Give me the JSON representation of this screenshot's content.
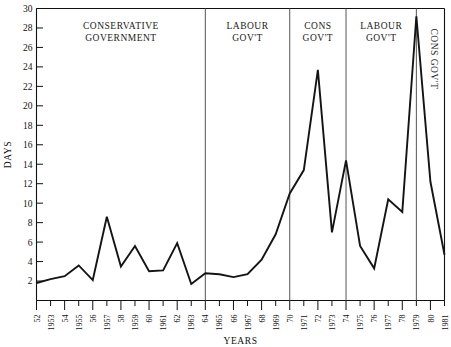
{
  "chart_data": {
    "type": "line",
    "title": "",
    "xlabel": "YEARS",
    "ylabel": "DAYS",
    "xlim": [
      1952,
      1981
    ],
    "ylim": [
      0,
      30
    ],
    "ytick_values": [
      2,
      4,
      6,
      8,
      10,
      12,
      14,
      16,
      18,
      20,
      22,
      24,
      26,
      28,
      30
    ],
    "ytick_labels": [
      "2",
      "4",
      "6",
      "8",
      "10",
      "12",
      "14",
      "16",
      "18",
      "20",
      "22",
      "24",
      "26",
      "28",
      "30"
    ],
    "grid": false,
    "legend": "none",
    "x": [
      1952,
      1953,
      1954,
      1955,
      1956,
      1957,
      1958,
      1959,
      1960,
      1961,
      1962,
      1963,
      1964,
      1965,
      1966,
      1967,
      1968,
      1969,
      1970,
      1971,
      1972,
      1973,
      1974,
      1975,
      1976,
      1977,
      1978,
      1979,
      1980,
      1981
    ],
    "xtick_labels": [
      "52",
      "1953",
      "54",
      "1955",
      "56",
      "1957",
      "58",
      "1959",
      "60",
      "1961",
      "62",
      "1963",
      "64",
      "1965",
      "66",
      "1967",
      "68",
      "1969",
      "70",
      "1971",
      "72",
      "1973",
      "74",
      "1975",
      "76",
      "1977",
      "78",
      "1979",
      "80",
      "1981"
    ],
    "values": [
      1.8,
      2.2,
      2.5,
      3.6,
      2.1,
      8.6,
      3.5,
      5.6,
      3.0,
      3.1,
      5.9,
      1.7,
      2.8,
      2.7,
      2.4,
      2.7,
      4.2,
      6.8,
      11.0,
      13.4,
      23.7,
      7.0,
      14.4,
      5.6,
      3.3,
      10.4,
      9.1,
      29.2,
      12.2,
      4.7
    ],
    "series_name": "Working days lost",
    "annotations": [
      {
        "label": "CONSERVATIVE GOVERNMENT",
        "start": 1952,
        "end": 1964,
        "orientation": "horizontal",
        "lines": [
          "CONSERVATIVE",
          "GOVERNMENT"
        ]
      },
      {
        "label": "LABOUR GOV'T",
        "start": 1964,
        "end": 1970,
        "orientation": "horizontal",
        "lines": [
          "LABOUR",
          "GOV'T"
        ]
      },
      {
        "label": "CONS GOV'T",
        "start": 1970,
        "end": 1974,
        "orientation": "horizontal",
        "lines": [
          "CONS",
          "GOV'T"
        ]
      },
      {
        "label": "LABOUR GOV'T",
        "start": 1974,
        "end": 1979,
        "orientation": "horizontal",
        "lines": [
          "LABOUR",
          "GOV'T"
        ]
      },
      {
        "label": "CONS GOV'T",
        "start": 1979,
        "end": 1981,
        "orientation": "vertical",
        "lines": [
          "CONS GOV'T"
        ]
      }
    ],
    "dividers": [
      1964,
      1970,
      1974,
      1979
    ],
    "colors": {
      "line": "#141414",
      "axis": "#111111",
      "divider": "#555555",
      "background": "#ffffff"
    }
  }
}
